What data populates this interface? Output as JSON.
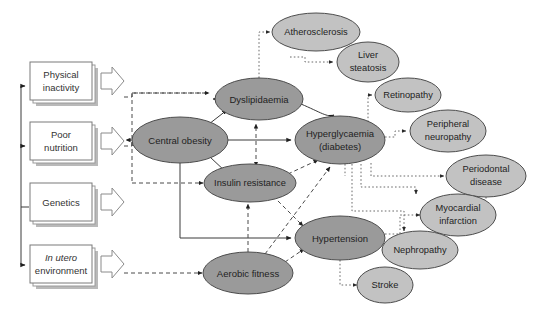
{
  "diagram": {
    "width": 536,
    "height": 310,
    "background": "#ffffff",
    "colors": {
      "ellipse_dark": "#9a9a9a",
      "ellipse_light": "#c2c2c2",
      "ellipse_stroke": "#4d4d4d",
      "box_fill": "#ffffff",
      "box_stroke": "#7a7a7a",
      "box_shadow": "#b9b9b9",
      "solid_edge": "#3a3a3a",
      "dashed_edge": "#4a4a4a",
      "dotted_edge": "#6a6a6a",
      "text": "#222222"
    },
    "risk_factors": [
      {
        "id": "physical-inactivity",
        "lines": [
          "Physical",
          "inactivity"
        ],
        "italic_first_line": false,
        "x": 60,
        "y": 81,
        "w": 62,
        "h": 38
      },
      {
        "id": "poor-nutrition",
        "lines": [
          "Poor",
          "nutrition"
        ],
        "italic_first_line": false,
        "x": 60,
        "y": 141,
        "w": 62,
        "h": 38
      },
      {
        "id": "genetics",
        "lines": [
          "Genetics"
        ],
        "italic_first_line": false,
        "x": 60,
        "y": 202,
        "w": 62,
        "h": 38
      },
      {
        "id": "in-utero-environment",
        "lines": [
          "In utero",
          "environment"
        ],
        "italic_first_line": true,
        "x": 60,
        "y": 264,
        "w": 62,
        "h": 38
      }
    ],
    "mediators": [
      {
        "id": "central-obesity",
        "lines": [
          "Central obesity"
        ],
        "cx": 180,
        "cy": 140,
        "rx": 48,
        "ry": 23,
        "shade": "dark"
      },
      {
        "id": "dyslipidaemia",
        "lines": [
          "Dyslipidaemia"
        ],
        "cx": 259,
        "cy": 99,
        "rx": 44,
        "ry": 21,
        "shade": "dark"
      },
      {
        "id": "insulin-resistance",
        "lines": [
          "Insulin resistance"
        ],
        "cx": 250,
        "cy": 183,
        "rx": 46,
        "ry": 19,
        "shade": "dark"
      },
      {
        "id": "hyperglycaemia-diabetes",
        "lines": [
          "Hyperglycaemia",
          "(diabetes)"
        ],
        "cx": 340,
        "cy": 140,
        "rx": 45,
        "ry": 24,
        "shade": "dark"
      },
      {
        "id": "hypertension",
        "lines": [
          "Hypertension"
        ],
        "cx": 340,
        "cy": 238,
        "rx": 45,
        "ry": 22,
        "shade": "dark"
      },
      {
        "id": "aerobic-fitness",
        "lines": [
          "Aerobic fitness"
        ],
        "cx": 248,
        "cy": 273,
        "rx": 45,
        "ry": 21,
        "shade": "dark"
      }
    ],
    "outcomes": [
      {
        "id": "atherosclerosis",
        "lines": [
          "Atherosclerosis"
        ],
        "cx": 316,
        "cy": 32,
        "rx": 44,
        "ry": 19,
        "shade": "light"
      },
      {
        "id": "liver-steatosis",
        "lines": [
          "Liver",
          "steatosis"
        ],
        "cx": 368,
        "cy": 62,
        "rx": 31,
        "ry": 20,
        "shade": "light"
      },
      {
        "id": "retinopathy",
        "lines": [
          "Retinopathy"
        ],
        "cx": 408,
        "cy": 95,
        "rx": 33,
        "ry": 17,
        "shade": "light"
      },
      {
        "id": "peripheral-neuropathy",
        "lines": [
          "Peripheral",
          "neuropathy"
        ],
        "cx": 448,
        "cy": 131,
        "rx": 38,
        "ry": 21,
        "shade": "light"
      },
      {
        "id": "periodontal-disease",
        "lines": [
          "Periodontal",
          "disease"
        ],
        "cx": 486,
        "cy": 176,
        "rx": 40,
        "ry": 21,
        "shade": "light"
      },
      {
        "id": "myocardial-infarction",
        "lines": [
          "Myocardial",
          "infarction"
        ],
        "cx": 458,
        "cy": 215,
        "rx": 38,
        "ry": 21,
        "shade": "light"
      },
      {
        "id": "nephropathy",
        "lines": [
          "Nephropathy"
        ],
        "cx": 420,
        "cy": 250,
        "rx": 38,
        "ry": 19,
        "shade": "light"
      },
      {
        "id": "stroke",
        "lines": [
          "Stroke"
        ],
        "cx": 385,
        "cy": 285,
        "rx": 28,
        "ry": 18,
        "shade": "light"
      }
    ],
    "legend_notes": {
      "solid": "direct causal link",
      "dashed": "modifying influence",
      "dotted": "complication pathway"
    }
  }
}
